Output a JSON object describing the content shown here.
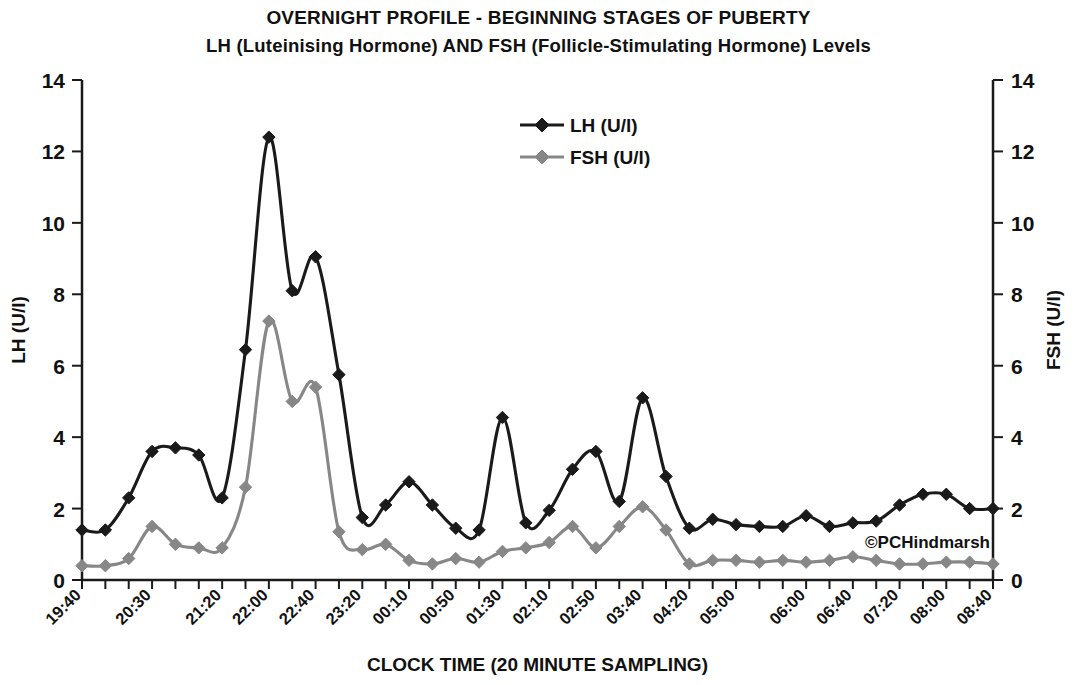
{
  "title": {
    "line1": "OVERNIGHT PROFILE  - BEGINNING STAGES OF PUBERTY",
    "line2": "LH (Luteinising Hormone) AND FSH (Follicle-Stimulating Hormone) Levels"
  },
  "watermark": "©PCHindmarsh",
  "colors": {
    "lh": "#1a1a1a",
    "fsh": "#878787",
    "axis": "#1a1a1a",
    "background": "#ffffff"
  },
  "chart_data": {
    "type": "line",
    "xlabel": "CLOCK TIME (20 MINUTE SAMPLING)",
    "ylabel": "LH (U/l)",
    "y2label": "FSH (U/l)",
    "ylim": [
      0,
      14
    ],
    "y2lim": [
      0,
      14
    ],
    "yticks": [
      0,
      2,
      4,
      6,
      8,
      10,
      12,
      14
    ],
    "y2ticks": [
      0,
      2,
      4,
      6,
      8,
      10,
      12,
      14
    ],
    "grid": false,
    "legend_position": "top-center",
    "x": [
      "19:40",
      "20:00",
      "20:20",
      "20:30",
      "20:50",
      "21:10",
      "21:20",
      "21:40",
      "22:00",
      "22:20",
      "22:40",
      "23:00",
      "23:20",
      "23:40",
      "00:10",
      "00:30",
      "00:50",
      "01:10",
      "01:30",
      "01:50",
      "02:10",
      "02:30",
      "02:50",
      "03:10",
      "03:40",
      "04:00",
      "04:20",
      "04:40",
      "05:00",
      "05:20",
      "05:40",
      "06:00",
      "06:20",
      "06:40",
      "07:00",
      "07:20",
      "07:40",
      "08:00",
      "08:20",
      "08:40"
    ],
    "xtick_labels": [
      "19:40",
      "20:30",
      "21:20",
      "22:00",
      "22:40",
      "23:20",
      "00:10",
      "00:50",
      "01:30",
      "02:10",
      "02:50",
      "03:40",
      "04:20",
      "05:00",
      "06:00",
      "06:40",
      "07:20",
      "08:00",
      "08:40"
    ],
    "xtick_label_indices": [
      0,
      3,
      6,
      8,
      10,
      12,
      14,
      16,
      18,
      20,
      22,
      24,
      26,
      28,
      31,
      33,
      35,
      37,
      39
    ],
    "series": [
      {
        "name": "LH (U/l)",
        "color": "#1a1a1a",
        "marker": "diamond",
        "axis": "left",
        "values": [
          1.4,
          1.4,
          2.3,
          3.6,
          3.7,
          3.5,
          2.3,
          6.45,
          12.4,
          8.1,
          9.05,
          5.75,
          1.75,
          2.1,
          2.75,
          2.1,
          1.45,
          1.4,
          4.55,
          1.6,
          1.95,
          3.1,
          3.6,
          2.2,
          5.1,
          2.9,
          1.45,
          1.7,
          1.55,
          1.5,
          1.5,
          1.8,
          1.5,
          1.6,
          1.65,
          2.1,
          2.4,
          2.4,
          2.0,
          2.0
        ]
      },
      {
        "name": "FSH (U/l)",
        "color": "#878787",
        "marker": "diamond",
        "axis": "right",
        "values": [
          0.4,
          0.4,
          0.6,
          1.5,
          1.0,
          0.9,
          0.9,
          2.6,
          7.25,
          5.0,
          5.4,
          1.35,
          0.85,
          1.0,
          0.55,
          0.45,
          0.6,
          0.5,
          0.8,
          0.9,
          1.05,
          1.5,
          0.9,
          1.5,
          2.05,
          1.4,
          0.45,
          0.55,
          0.55,
          0.5,
          0.55,
          0.5,
          0.55,
          0.65,
          0.55,
          0.45,
          0.45,
          0.5,
          0.5,
          0.45
        ]
      }
    ]
  },
  "legend": [
    {
      "label": "LH (U/l)",
      "color": "#1a1a1a"
    },
    {
      "label": "FSH (U/l)",
      "color": "#878787"
    }
  ]
}
